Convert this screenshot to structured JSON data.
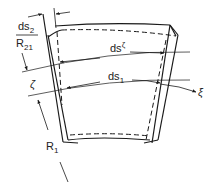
{
  "diagram": {
    "labels": {
      "ds2_num": "ds",
      "ds2_sub": "2",
      "r21_den": "R",
      "r21_sub": "21",
      "zeta": "ζ",
      "r1": "R",
      "r1_sub": "1",
      "ds_zeta": "ds",
      "ds_zeta_sup": "ζ",
      "ds1": "ds",
      "ds1_sub": "1",
      "xi": "ξ"
    },
    "colors": {
      "stroke": "#1a1a1a",
      "thin": "#333333"
    }
  }
}
